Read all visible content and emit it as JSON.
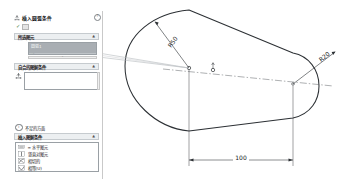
{
  "panel": {
    "header": {
      "icon": "dimension-icon",
      "title": "插入圆弧条件",
      "help_icon": "?"
    },
    "confirm": {
      "check_icon": "✓",
      "button_icon": "▣",
      "button_label": ""
    },
    "sections": [
      {
        "id": "edge-select",
        "title": "所选图元",
        "chevron": "▲",
        "items": [
          {
            "label": "圆弧1",
            "state": "selected"
          },
          {
            "label": "线1",
            "state": "selected-alt"
          }
        ],
        "scroll_hint": "⌄"
      },
      {
        "id": "auto-relations",
        "title": "自合的图解条件",
        "chevron": "▲",
        "icon": "dimension-icon",
        "value": "",
        "placeholder": ""
      }
    ],
    "note": {
      "icon": "i",
      "text": "不足的方面"
    },
    "relations": {
      "title": "插入图解条件",
      "chevron": "▲",
      "items": [
        {
          "icon": "horizontal-icon",
          "label": "= 水平图元"
        },
        {
          "icon": "vertical-icon",
          "label": "竖直对图元"
        },
        {
          "icon": "tangent-icon",
          "label": "相切的"
        },
        {
          "icon": "equal-icon",
          "label": "相等(U)"
        }
      ]
    }
  },
  "drawing": {
    "dimensions": [
      {
        "id": "radius-left",
        "label": "R50",
        "type": "radius"
      },
      {
        "id": "radius-right",
        "label": "R20",
        "type": "radius"
      },
      {
        "id": "length",
        "label": "100",
        "type": "linear"
      }
    ],
    "entities": {
      "shape": "slot",
      "centerline": true,
      "center_points": 2
    }
  }
}
